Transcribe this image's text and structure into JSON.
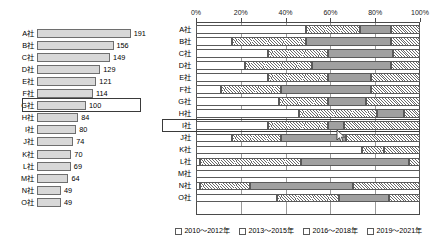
{
  "chart_data": [
    {
      "type": "bar",
      "orientation": "horizontal",
      "title": "",
      "xlabel": "",
      "ylabel": "",
      "categories": [
        "A社",
        "B社",
        "C社",
        "D社",
        "E社",
        "F社",
        "G社",
        "H社",
        "I社",
        "J社",
        "K社",
        "L社",
        "M社",
        "N社",
        "O社"
      ],
      "values": [
        191,
        156,
        149,
        129,
        121,
        114,
        100,
        84,
        80,
        74,
        70,
        69,
        64,
        49,
        49
      ],
      "value_labels": [
        "191",
        "156",
        "149",
        "129",
        "121",
        "114",
        "100",
        "84",
        "80",
        "74",
        "70",
        "69",
        "64",
        "49",
        "49"
      ],
      "xlim": [
        0,
        210
      ],
      "grid": false,
      "highlighted_category": "G社",
      "bar_fill": "#d8d8d8",
      "bar_stroke": "#6e6e6e"
    },
    {
      "type": "bar",
      "subtype": "stacked-100",
      "orientation": "horizontal",
      "title": "",
      "xlabel": "",
      "ylabel": "",
      "categories": [
        "A社",
        "B社",
        "C社",
        "D社",
        "E社",
        "F社",
        "G社",
        "H社",
        "I社",
        "J社",
        "K社",
        "L社",
        "M社",
        "N社",
        "O社"
      ],
      "xtick_labels": [
        "0%",
        "20%",
        "40%",
        "60%",
        "80%",
        "100%"
      ],
      "xticks": [
        0,
        20,
        40,
        60,
        80,
        100
      ],
      "xlim": [
        0,
        100
      ],
      "grid": true,
      "legend_position": "bottom",
      "highlighted_category": "I社",
      "series": [
        {
          "name": "2010～2012年",
          "pattern": "solid-white",
          "color": "#ffffff",
          "values": [
            49,
            16,
            32,
            22,
            32,
            11,
            37,
            46,
            32,
            16,
            74,
            2,
            100,
            2,
            36
          ]
        },
        {
          "name": "2013～2015年",
          "pattern": "diagonal-hatch",
          "color": "#ffffff",
          "values": [
            24,
            33,
            27,
            30,
            27,
            27,
            22,
            35,
            27,
            22,
            10,
            45,
            0,
            22,
            28
          ]
        },
        {
          "name": "2016～2018年",
          "pattern": "solid-gray",
          "color": "#a0a0a0",
          "values": [
            14,
            38,
            29,
            35,
            19,
            40,
            17,
            12,
            7,
            29,
            0,
            48,
            0,
            46,
            22
          ]
        },
        {
          "name": "2019～2021年",
          "pattern": "crosshatch",
          "color": "#ffffff",
          "values": [
            13,
            13,
            12,
            13,
            22,
            22,
            24,
            7,
            34,
            33,
            16,
            5,
            0,
            30,
            14
          ]
        }
      ]
    }
  ],
  "left_chart": {
    "rows": [
      {
        "label": "A社",
        "value": 191
      },
      {
        "label": "B社",
        "value": 156
      },
      {
        "label": "C社",
        "value": 149
      },
      {
        "label": "D社",
        "value": 129
      },
      {
        "label": "E社",
        "value": 121
      },
      {
        "label": "F社",
        "value": 114
      },
      {
        "label": "G社",
        "value": 100
      },
      {
        "label": "H社",
        "value": 84
      },
      {
        "label": "I社",
        "value": 80
      },
      {
        "label": "J社",
        "value": 74
      },
      {
        "label": "K社",
        "value": 70
      },
      {
        "label": "L社",
        "value": 69
      },
      {
        "label": "M社",
        "value": 64
      },
      {
        "label": "N社",
        "value": 49
      },
      {
        "label": "O社",
        "value": 49
      }
    ]
  },
  "right_chart": {
    "axis": {
      "ticks": [
        "0%",
        "20%",
        "40%",
        "60%",
        "80%",
        "100%"
      ]
    },
    "rows": [
      {
        "label": "A社"
      },
      {
        "label": "B社"
      },
      {
        "label": "C社"
      },
      {
        "label": "D社"
      },
      {
        "label": "E社"
      },
      {
        "label": "F社"
      },
      {
        "label": "G社"
      },
      {
        "label": "H社"
      },
      {
        "label": "I社"
      },
      {
        "label": "J社"
      },
      {
        "label": "K社"
      },
      {
        "label": "L社"
      },
      {
        "label": "M社"
      },
      {
        "label": "N社"
      },
      {
        "label": "O社"
      }
    ]
  },
  "legend": {
    "items": [
      {
        "label": "2010～2012年"
      },
      {
        "label": "2013～2015年"
      },
      {
        "label": "2016～2018年"
      },
      {
        "label": "2019～2021年"
      }
    ]
  }
}
